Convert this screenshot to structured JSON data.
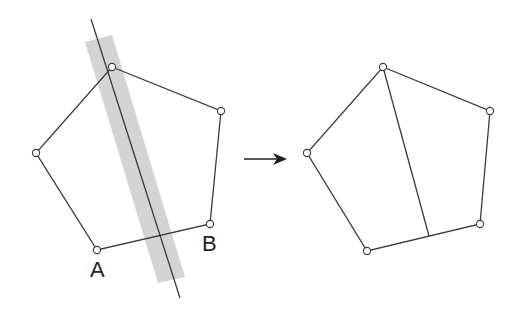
{
  "figure": {
    "colors": {
      "stroke": "#3a3a3a",
      "band": "#cfcfcf",
      "vertex_fill": "#ffffff",
      "label": "#222222"
    },
    "left_panel": {
      "vertices": [
        [
          112,
          67
        ],
        [
          221,
          111
        ],
        [
          210,
          224
        ],
        [
          97,
          250
        ],
        [
          36,
          153
        ]
      ],
      "labels": [
        {
          "text": "A",
          "x": 90,
          "y": 277
        },
        {
          "text": "B",
          "x": 202,
          "y": 251
        }
      ],
      "cut_line": {
        "x1": 91,
        "y1": 19,
        "x2": 180,
        "y2": 298
      },
      "band": [
        [
          85,
          42
        ],
        [
          112,
          35
        ],
        [
          185,
          277
        ],
        [
          158,
          283
        ]
      ]
    },
    "arrow": {
      "x1": 244,
      "y1": 159,
      "x2": 287,
      "y2": 159
    },
    "right_panel": {
      "vertices": [
        [
          383,
          67
        ],
        [
          490,
          111
        ],
        [
          480,
          224
        ],
        [
          367,
          251
        ],
        [
          307,
          153
        ]
      ],
      "cut_segment": {
        "x1": 383,
        "y1": 67,
        "x2": 429,
        "y2": 236
      }
    }
  }
}
